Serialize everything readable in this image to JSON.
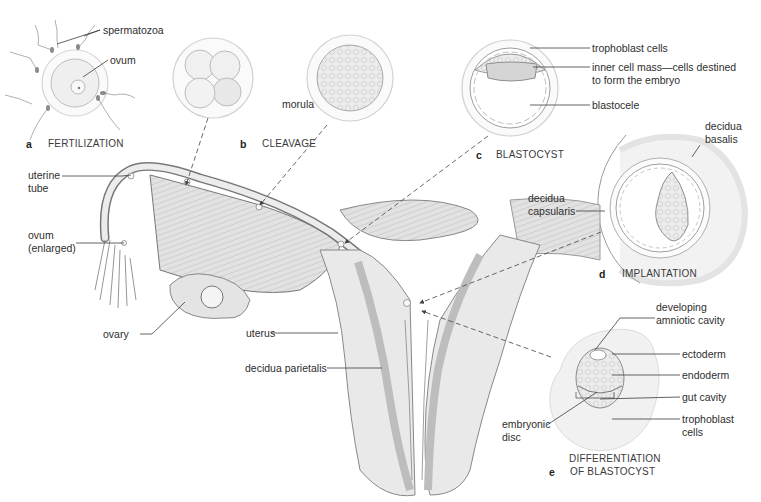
{
  "figure": {
    "type": "anatomical-illustration",
    "colors": {
      "line": "#6e6e6e",
      "tissue": "#e6e6e6",
      "tissue_dark": "#c9c9c9",
      "text": "#2e2e2e",
      "background": "#ffffff"
    }
  },
  "panels": [
    {
      "letter": "a",
      "caption": "FERTILIZATION"
    },
    {
      "letter": "b",
      "caption": "CLEAVAGE"
    },
    {
      "letter": "c",
      "caption": "BLASTOCYST"
    },
    {
      "letter": "d",
      "caption": "IMPLANTATION"
    },
    {
      "letter": "e",
      "caption_line1": "DIFFERENTIATION",
      "caption_line2": "OF BLASTOCYST"
    }
  ],
  "labels": {
    "spermatozoa": "spermatozoa",
    "ovum": "ovum",
    "morula": "morula",
    "trophoblast_cells": "trophoblast cells",
    "inner_cell_mass": "inner cell mass—cells destined\nto form the embryo",
    "blastocele": "blastocele",
    "decidua_basalis": "decidua\nbasalis",
    "decidua_capsularis": "decidua\ncapsularis",
    "uterine_tube": "uterine\ntube",
    "ovum_enlarged": "ovum\n(enlarged)",
    "ovary": "ovary",
    "uterus": "uterus",
    "decidua_parietalis": "decidua parietalis",
    "developing_amniotic_cavity": "developing\namniotic cavity",
    "ectoderm": "ectoderm",
    "endoderm": "endoderm",
    "gut_cavity": "gut cavity",
    "trophoblast_cells_e": "trophoblast\ncells",
    "embryonic_disc": "embryonic\ndisc"
  }
}
